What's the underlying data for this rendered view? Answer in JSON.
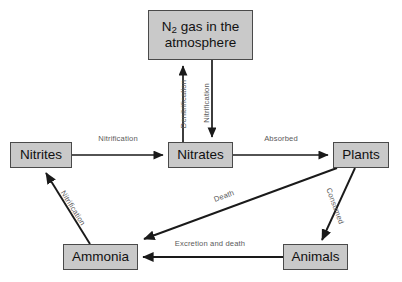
{
  "diagram": {
    "type": "flow-diagram",
    "background_color": "#ffffff",
    "node_fill_color": "#c9c9c9",
    "node_border_color": "#4a4a4a",
    "arrow_color": "#1a1a1a",
    "label_color": "#5a5a5a",
    "nodes": [
      {
        "id": "atmosphere",
        "label_line1_prefix": "N",
        "label_line1_sub": "2",
        "label_line1_suffix": " gas in the",
        "label_line2": "atmosphere",
        "label_plain": "N2 gas in the atmosphere",
        "x": 148,
        "y": 10,
        "w": 105,
        "h": 50
      },
      {
        "id": "nitrites",
        "label": "Nitrites",
        "x": 10,
        "y": 142,
        "w": 62,
        "h": 26
      },
      {
        "id": "nitrates",
        "label": "Nitrates",
        "x": 168,
        "y": 142,
        "w": 65,
        "h": 26
      },
      {
        "id": "plants",
        "label": "Plants",
        "x": 333,
        "y": 142,
        "w": 56,
        "h": 26
      },
      {
        "id": "ammonia",
        "label": "Ammonia",
        "x": 63,
        "y": 244,
        "w": 75,
        "h": 26
      },
      {
        "id": "animals",
        "label": "Animals",
        "x": 283,
        "y": 244,
        "w": 65,
        "h": 26
      }
    ],
    "edges": [
      {
        "id": "denitrification",
        "label": "Denitrification",
        "from": "nitrates",
        "to": "atmosphere",
        "direction": "up",
        "label_x": 183,
        "label_y": 104,
        "label_rotate": -90
      },
      {
        "id": "nitrification-atmosphere-to-nitrates",
        "label": "Nitrification",
        "from": "atmosphere",
        "to": "nitrates",
        "direction": "down",
        "label_x": 212,
        "label_y": 103,
        "label_rotate": -90
      },
      {
        "id": "nitrification-nitrites-to-nitrates",
        "label": "Nitrification",
        "from": "nitrites",
        "to": "nitrates",
        "direction": "right",
        "label_x": 118,
        "label_y": 138,
        "label_rotate": 0
      },
      {
        "id": "absorbed",
        "label": "Absorbed",
        "from": "nitrates",
        "to": "plants",
        "direction": "right",
        "label_x": 281,
        "label_y": 138,
        "label_rotate": 0
      },
      {
        "id": "consumed",
        "label": "Consumed",
        "from": "plants",
        "to": "animals",
        "direction": "down-right",
        "label_x": 331,
        "label_y": 206,
        "label_rotate": 70
      },
      {
        "id": "death",
        "label": "Death",
        "from": "plants",
        "to": "ammonia",
        "direction": "down-left",
        "label_x": 224,
        "label_y": 196,
        "label_rotate": -14
      },
      {
        "id": "excretion-and-death",
        "label": "Excretion and death",
        "from": "animals",
        "to": "ammonia",
        "direction": "left",
        "label_x": 210,
        "label_y": 243,
        "label_rotate": 0
      },
      {
        "id": "nitrification-ammonia-to-nitrites",
        "label": "Nitrification",
        "from": "ammonia",
        "to": "nitrites",
        "direction": "up-left",
        "label_x": 73,
        "label_y": 208,
        "label_rotate": 62
      }
    ]
  }
}
